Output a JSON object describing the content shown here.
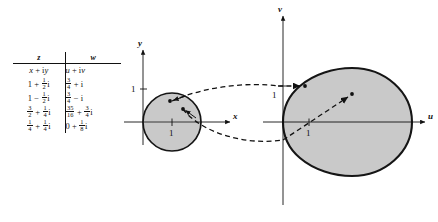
{
  "page": {
    "number": ""
  },
  "table": {
    "name": "z-to-w-mapping-table",
    "headers": {
      "z": "z",
      "w": "w"
    },
    "rows": [
      {
        "z_text": "x + iy",
        "w_text": "u + iv"
      },
      {
        "z_text": "1 + 1/2 i",
        "w_text": "3/4 + i"
      },
      {
        "z_text": "1 - 1/2 i",
        "w_text": "3/4 - i"
      },
      {
        "z_text": "3/2 + 1/4 i",
        "w_text": "35/16 + 3/4 i"
      },
      {
        "z_text": "1/4 + 1/4 i",
        "w_text": "0 + 1/8 i"
      }
    ]
  },
  "z_plane": {
    "name": "z-plane-diagram",
    "y_axis_label": "y",
    "x_axis_label": "x",
    "y_tick_label": "1",
    "x_tick_label": "1",
    "region": "shaded disk centered at 1 with radius 1",
    "points": [
      {
        "label": "point-a",
        "z": "1 + 1/2 i"
      },
      {
        "label": "point-b",
        "z": "3/2 + 1/4 i"
      }
    ]
  },
  "w_plane": {
    "name": "w-plane-diagram",
    "v_axis_label": "v",
    "u_axis_label": "u",
    "v_tick_label": "1",
    "u_tick_label": "1",
    "region": "shaded cardioid with cusp at origin opening to the right",
    "points": [
      {
        "label": "image-point-a",
        "w": "3/4 + i"
      },
      {
        "label": "image-point-b",
        "w": "35/16 + 3/4 i"
      }
    ]
  },
  "colors": {
    "ink": "#111111",
    "shade": "#c9c9c9",
    "shade_edge": "#151515",
    "page": "#ffffff"
  }
}
